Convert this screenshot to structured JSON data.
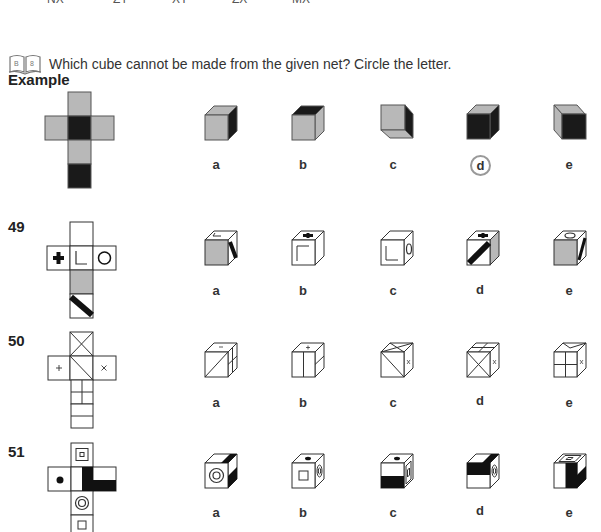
{
  "top_cut_text": [
    "NX",
    "ZY",
    "XY",
    "ZX",
    "MX"
  ],
  "instruction": {
    "icon": "book-icon",
    "icon_pages": [
      "B",
      "8"
    ],
    "text": "Which cube cannot be made from the given net? Circle the letter."
  },
  "example": {
    "label": "Example",
    "net": "cross net: top grey, middle-row grey/black/grey, below grey, bottom black",
    "options": [
      {
        "letter": "a",
        "description": "grey front, grey top, black right side"
      },
      {
        "letter": "b",
        "description": "grey front, black top, grey right side"
      },
      {
        "letter": "c",
        "description": "grey front, grey bottom, black right side"
      },
      {
        "letter": "d",
        "description": "black front, grey top, black right side",
        "circled": true
      },
      {
        "letter": "e",
        "description": "black front, grey left side"
      }
    ],
    "answer": "d"
  },
  "questions": [
    {
      "number": "49",
      "net_faces": [
        "blank (top)",
        "bold plus",
        "L corner",
        "circle",
        "grey",
        "black diagonal stripe"
      ],
      "options": [
        {
          "letter": "a",
          "description": "grey front, L top, black stripe right"
        },
        {
          "letter": "b",
          "description": "corner front, plus top, blank right"
        },
        {
          "letter": "c",
          "description": "L front, blank top, circle right"
        },
        {
          "letter": "d",
          "description": "stripe front, plus top, grey right"
        },
        {
          "letter": "e",
          "description": "grey front, circle top, stripe right"
        }
      ]
    },
    {
      "number": "50",
      "net_faces": [
        "X cross",
        "plus",
        "single diagonal",
        "small x",
        "T grid",
        "horizontal lines"
      ],
      "options": [
        {
          "letter": "a",
          "description": "diagonal front, plus top, grid right"
        },
        {
          "letter": "b",
          "description": "vertical split front, plus top, grid right"
        },
        {
          "letter": "c",
          "description": "diagonal front, X top, x right"
        },
        {
          "letter": "d",
          "description": "X front, grid top, x right"
        },
        {
          "letter": "e",
          "description": "four-grid front, triangle top, x right"
        }
      ]
    },
    {
      "number": "51",
      "net_faces": [
        "small square in square",
        "dot",
        "blank",
        "black L-shape",
        "concentric circles",
        "small square"
      ],
      "options": [
        {
          "letter": "a",
          "description": "circles front, black top-right, black side"
        },
        {
          "letter": "b",
          "description": "square front, dot top, circles right"
        },
        {
          "letter": "c",
          "description": "black half front, dot top, square right"
        },
        {
          "letter": "d",
          "description": "black half front, black top, circles right"
        },
        {
          "letter": "e",
          "description": "black half vertical front, square top, black right"
        }
      ]
    }
  ],
  "colors": {
    "grey": "#b8b8b8",
    "black": "#1a1a1a",
    "line": "#333333",
    "circle": "#999999"
  }
}
